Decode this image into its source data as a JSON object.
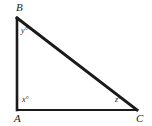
{
  "figure": {
    "type": "right-triangle-diagram",
    "background_color": "#ffffff",
    "stroke_color": "#1a1a1a",
    "vertices": [
      {
        "id": "B",
        "label": "B",
        "x": 17,
        "y": 18
      },
      {
        "id": "A",
        "label": "A",
        "x": 17,
        "y": 110
      },
      {
        "id": "C",
        "label": "C",
        "x": 137,
        "y": 110
      }
    ],
    "angles": [
      {
        "at_vertex": "B",
        "label": "y°"
      },
      {
        "at_vertex": "A",
        "label": "x°"
      },
      {
        "at_vertex": "C",
        "label": "z°"
      }
    ],
    "sides": [
      {
        "name": "leg-vertical-AB",
        "from": "A",
        "to": "B",
        "stroke_width": 2.6
      },
      {
        "name": "leg-horizontal-AC",
        "from": "A",
        "to": "C",
        "stroke_width": 2.0
      },
      {
        "name": "hypotenuse-BC",
        "from": "B",
        "to": "C",
        "stroke_width": 3.0
      }
    ]
  }
}
